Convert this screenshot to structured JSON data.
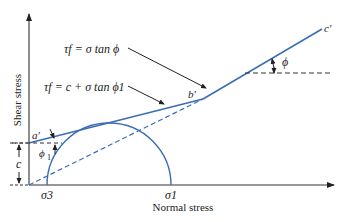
{
  "diagram": {
    "type": "mohr-coulomb failure envelope",
    "axes": {
      "x_label": "Normal stress",
      "y_label": "Shear stress"
    },
    "equations": {
      "envelope_overconsolidated": "τf = c + σ tan ϕ1",
      "envelope_normally_consolidated": "τf = σ tan ϕ"
    },
    "points": {
      "a": "a′",
      "b": "b′",
      "c": "c′"
    },
    "stresses": {
      "sigma3": "σ3",
      "sigma1": "σ1"
    },
    "angles": {
      "phi": "ϕ",
      "phi1": "ϕ1"
    },
    "dimensions": {
      "cohesion": "c"
    },
    "colors": {
      "envelope": "#3a6db5",
      "circle": "#3a6db5",
      "axis": "#333333",
      "text": "#222222"
    }
  }
}
